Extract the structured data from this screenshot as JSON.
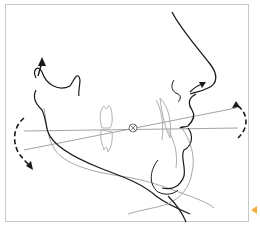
{
  "figure": {
    "colors": {
      "primary_stroke": "#1a1a1a",
      "secondary_stroke": "#9a9a9a",
      "frame": "#c8c8c8",
      "marker": "#f0b040"
    },
    "elements": [
      "soft-tissue-profile",
      "mandible-outline-original",
      "mandible-outline-rotated",
      "ear-condyle-arrow",
      "left-rotation-arrow",
      "right-rotation-arrow",
      "occlusal-plane-lines",
      "rotation-center",
      "molar-teeth",
      "incisor-teeth"
    ]
  }
}
